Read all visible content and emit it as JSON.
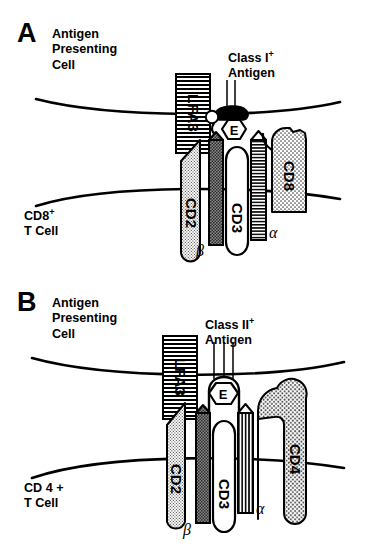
{
  "figure": {
    "type": "diagram",
    "panels": [
      {
        "id": "A",
        "letter": "A",
        "apc_label": "Antigen\nPresenting\nCell",
        "tcell_label_main": "CD8",
        "tcell_label_sup": "+",
        "tcell_label_line2": "T Cell",
        "antigen_label_main": "Class I",
        "antigen_label_sup": "+",
        "antigen_label_line2": "Antigen",
        "molecules": [
          {
            "name": "LFA3",
            "label": "LFA3",
            "fill": "horizontal-stripes",
            "side": "apc"
          },
          {
            "name": "CD2",
            "label": "CD2",
            "fill": "fine-stipple",
            "side": "tcell"
          },
          {
            "name": "MHC-class-I",
            "label": "",
            "fill": "solid-black",
            "side": "apc"
          },
          {
            "name": "peptide-epitope",
            "label": "E",
            "fill": "white",
            "side": "apc"
          },
          {
            "name": "beta2-microglobulin",
            "label": "",
            "fill": "white",
            "side": "apc"
          },
          {
            "name": "TCR-beta-chain",
            "label": "",
            "greek": "β",
            "fill": "dark-stipple",
            "side": "tcell"
          },
          {
            "name": "CD3",
            "label": "CD3",
            "fill": "white",
            "side": "tcell"
          },
          {
            "name": "TCR-alpha-chain",
            "label": "",
            "greek": "α",
            "fill": "horizontal-stripes",
            "side": "tcell"
          },
          {
            "name": "CD8",
            "label": "CD8",
            "fill": "coarse-stipple",
            "side": "tcell"
          }
        ],
        "greek_beta": "β",
        "greek_alpha": "α",
        "epitope_letter": "E"
      },
      {
        "id": "B",
        "letter": "B",
        "apc_label": "Antigen\nPresenting\nCell",
        "tcell_label_main": "CD 4 +",
        "tcell_label_sup": "",
        "tcell_label_line2": "T Cell",
        "antigen_label_main": "Class II",
        "antigen_label_sup": "+",
        "antigen_label_line2": "Antigen",
        "molecules": [
          {
            "name": "LFA3",
            "label": "LFA3",
            "fill": "horizontal-stripes",
            "side": "apc"
          },
          {
            "name": "CD2",
            "label": "CD2",
            "fill": "fine-stipple",
            "side": "tcell"
          },
          {
            "name": "MHC-class-II",
            "label": "",
            "fill": "white-outline",
            "side": "apc"
          },
          {
            "name": "peptide-epitope",
            "label": "E",
            "fill": "white",
            "side": "apc"
          },
          {
            "name": "TCR-beta-chain",
            "label": "",
            "greek": "β",
            "fill": "dark-stipple",
            "side": "tcell"
          },
          {
            "name": "CD3",
            "label": "CD3",
            "fill": "white",
            "side": "tcell"
          },
          {
            "name": "TCR-alpha-chain",
            "label": "",
            "greek": "α",
            "fill": "vertical-stripes",
            "side": "tcell"
          },
          {
            "name": "CD4",
            "label": "CD4",
            "fill": "coarse-stipple",
            "side": "tcell"
          }
        ],
        "greek_beta": "β",
        "greek_alpha": "α",
        "epitope_letter": "E"
      }
    ],
    "colors": {
      "ink": "#000000",
      "background": "#ffffff",
      "stipple_light": "#d9d9d9",
      "stipple_dark": "#6e6e6e"
    }
  }
}
